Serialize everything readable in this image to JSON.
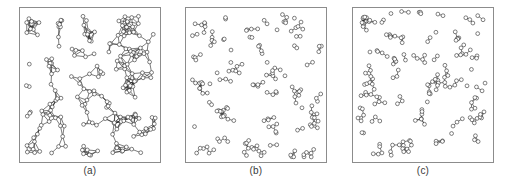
{
  "figure": {
    "background_color": "#ffffff",
    "frame_color": "#8c8c8c",
    "ink_color": "#2b2b2b",
    "node_fill": "#ffffff",
    "node_radius": 1.9,
    "panel_count": 3
  },
  "panels": [
    {
      "id": "a",
      "caption": "(a)",
      "description": "dense spatial network with many clustered triangulated links",
      "node_count": 200,
      "edge_count": 520,
      "connection_radius": 14,
      "seed": 11
    },
    {
      "id": "b",
      "caption": "(b)",
      "description": "sparse tree-like spatial network, low degree",
      "node_count": 200,
      "edge_count": 200,
      "connection_radius": 8.5,
      "seed": 29
    },
    {
      "id": "c",
      "caption": "(c)",
      "description": "intermediate sparse spatial network with short branching chains",
      "node_count": 200,
      "edge_count": 230,
      "connection_radius": 9.5,
      "seed": 47
    }
  ],
  "chart_data": {
    "type": "scatter",
    "title": "",
    "subtitle": "",
    "xlabel": "",
    "ylabel": "",
    "xlim": [
      0,
      100
    ],
    "ylim": [
      0,
      100
    ],
    "grid": false,
    "legend": null,
    "annotations": [
      "(a)",
      "(b)",
      "(c)"
    ],
    "series": [
      {
        "name": "(a)",
        "kind": "graph",
        "nodes": 200,
        "edges": 520,
        "mean_degree": 5.2,
        "layout": "uniform-random-in-unit-square",
        "edge_rule": "connect pairs closer than radius 14 (of 100)"
      },
      {
        "name": "(b)",
        "kind": "graph",
        "nodes": 200,
        "edges": 200,
        "mean_degree": 2.0,
        "layout": "uniform-random-in-unit-square",
        "edge_rule": "connect pairs closer than radius 8.5 (of 100)"
      },
      {
        "name": "(c)",
        "kind": "graph",
        "nodes": 200,
        "edges": 230,
        "mean_degree": 2.3,
        "layout": "uniform-random-in-unit-square",
        "edge_rule": "connect pairs closer than radius 9.5 (of 100)"
      }
    ]
  }
}
